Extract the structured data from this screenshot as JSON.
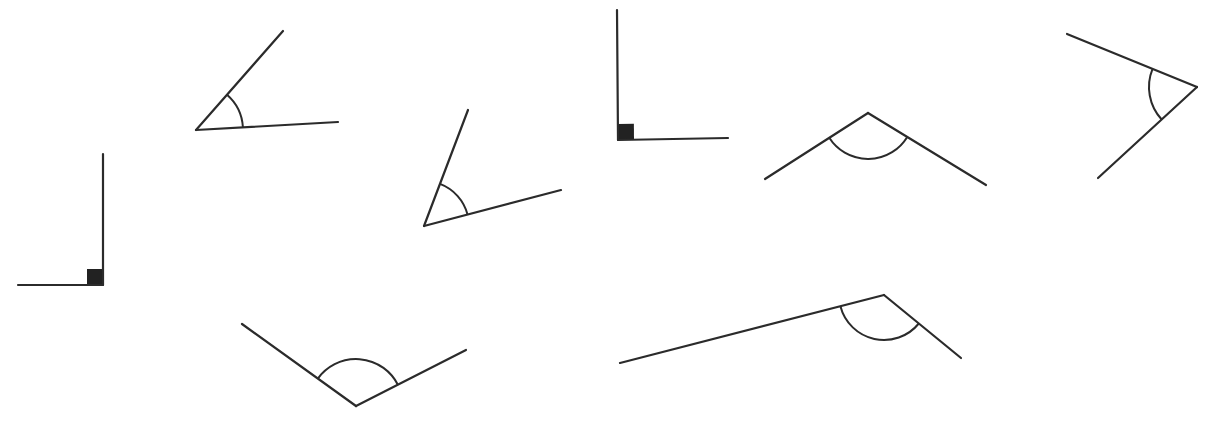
{
  "colors": {
    "stroke": "#2b2b2b",
    "square_fill": "#222222",
    "background": "#ffffff"
  },
  "angles": [
    {
      "id": "angle-1",
      "type": "right",
      "marker": "square",
      "vertex": [
        103,
        285
      ],
      "ray_a": [
        103,
        154
      ],
      "ray_b": [
        18,
        285
      ],
      "marker_size": 16
    },
    {
      "id": "angle-2",
      "type": "acute",
      "marker": "arc",
      "vertex": [
        196,
        130
      ],
      "ray_a": [
        283,
        31
      ],
      "ray_b": [
        338,
        122
      ],
      "arc_radius": 47
    },
    {
      "id": "angle-3",
      "type": "acute",
      "marker": "arc",
      "vertex": [
        424,
        226
      ],
      "ray_a": [
        468,
        110
      ],
      "ray_b": [
        561,
        190
      ],
      "arc_radius": 45
    },
    {
      "id": "angle-4",
      "type": "right",
      "marker": "square",
      "vertex": [
        618,
        140
      ],
      "ray_a": [
        617,
        10
      ],
      "ray_b": [
        728,
        138
      ],
      "marker_size": 16
    },
    {
      "id": "angle-5",
      "type": "obtuse",
      "marker": "arc",
      "vertex": [
        868,
        113
      ],
      "ray_a": [
        765,
        179
      ],
      "ray_b": [
        986,
        185
      ],
      "arc_radius": 46
    },
    {
      "id": "angle-6",
      "type": "acute",
      "marker": "arc",
      "vertex": [
        1197,
        87
      ],
      "ray_a": [
        1067,
        34
      ],
      "ray_b": [
        1098,
        178
      ],
      "arc_radius": 48
    },
    {
      "id": "angle-7",
      "type": "obtuse",
      "marker": "arc",
      "vertex": [
        356,
        406
      ],
      "ray_a": [
        242,
        324
      ],
      "ray_b": [
        466,
        350
      ],
      "arc_radius": 47
    },
    {
      "id": "angle-8",
      "type": "obtuse",
      "marker": "arc",
      "vertex": [
        884,
        295
      ],
      "ray_a": [
        620,
        363
      ],
      "ray_b": [
        961,
        358
      ],
      "arc_radius": 45
    }
  ]
}
